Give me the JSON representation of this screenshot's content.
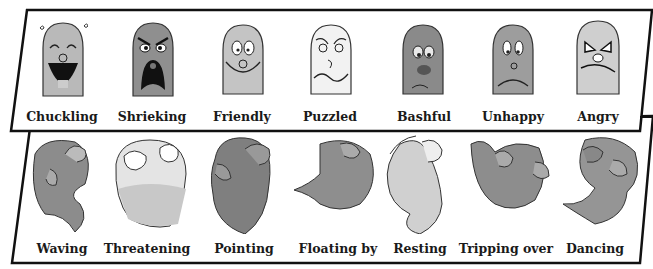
{
  "faces_panel": {
    "items": [
      {
        "label": "Chuckling",
        "x": 62,
        "tone": "#b9b9b9"
      },
      {
        "label": "Shrieking",
        "x": 152,
        "tone": "#8f8f8f"
      },
      {
        "label": "Friendly",
        "x": 242,
        "tone": "#c4c4c4"
      },
      {
        "label": "Puzzled",
        "x": 330,
        "tone": "#f2f2f2"
      },
      {
        "label": "Bashful",
        "x": 424,
        "tone": "#8a8a8a"
      },
      {
        "label": "Unhappy",
        "x": 513,
        "tone": "#9d9d9d"
      },
      {
        "label": "Angry",
        "x": 598,
        "tone": "#cfcfcf"
      }
    ]
  },
  "bodies_panel": {
    "items": [
      {
        "label": "Waving",
        "x": 62,
        "tone": "#8c8c8c"
      },
      {
        "label": "Threatening",
        "x": 147,
        "tone": "#c8c8c8"
      },
      {
        "label": "Pointing",
        "x": 244,
        "tone": "#7f7f7f"
      },
      {
        "label": "Floating by",
        "x": 338,
        "tone": "#8e8e8e"
      },
      {
        "label": "Resting",
        "x": 420,
        "tone": "#d0d0d0"
      },
      {
        "label": "Tripping over",
        "x": 506,
        "tone": "#8d8d8d"
      },
      {
        "label": "Dancing",
        "x": 595,
        "tone": "#959595"
      }
    ]
  }
}
